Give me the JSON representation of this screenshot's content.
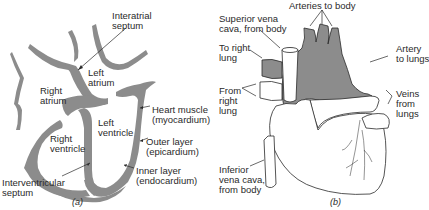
{
  "colors": {
    "muscle_gray": "#8c8c8c",
    "outline": "#2a2a2a",
    "background": "#ffffff",
    "text": "#2a2a2a"
  },
  "panel_a": {
    "caption": "(a)",
    "labels": {
      "interatrial_septum": "Interatrial\nseptum",
      "left_atrium": "Left\natrium",
      "right_atrium": "Right\natrium",
      "heart_muscle": "Heart muscle\n(myocardium)",
      "left_ventricle": "Left\nventricle",
      "right_ventricle": "Right\nventricle",
      "outer_layer": "Outer layer\n(epicardium)",
      "inner_layer": "Inner layer\n(endocardium)",
      "interventricular_septum": "Interventricular\nseptum"
    }
  },
  "panel_b": {
    "caption": "(b)",
    "labels": {
      "arteries_to_body": "Arteries to body",
      "superior_vena_cava": "Superior vena\ncava, from body",
      "to_right_lung": "To right\nlung",
      "artery_to_lungs": "Artery\nto lungs",
      "from_right_lung": "From\nright\nlung",
      "veins_from_lungs": "Veins\nfrom\nlungs",
      "inferior_vena_cava": "Inferior\nvena cava,\nfrom body"
    }
  }
}
